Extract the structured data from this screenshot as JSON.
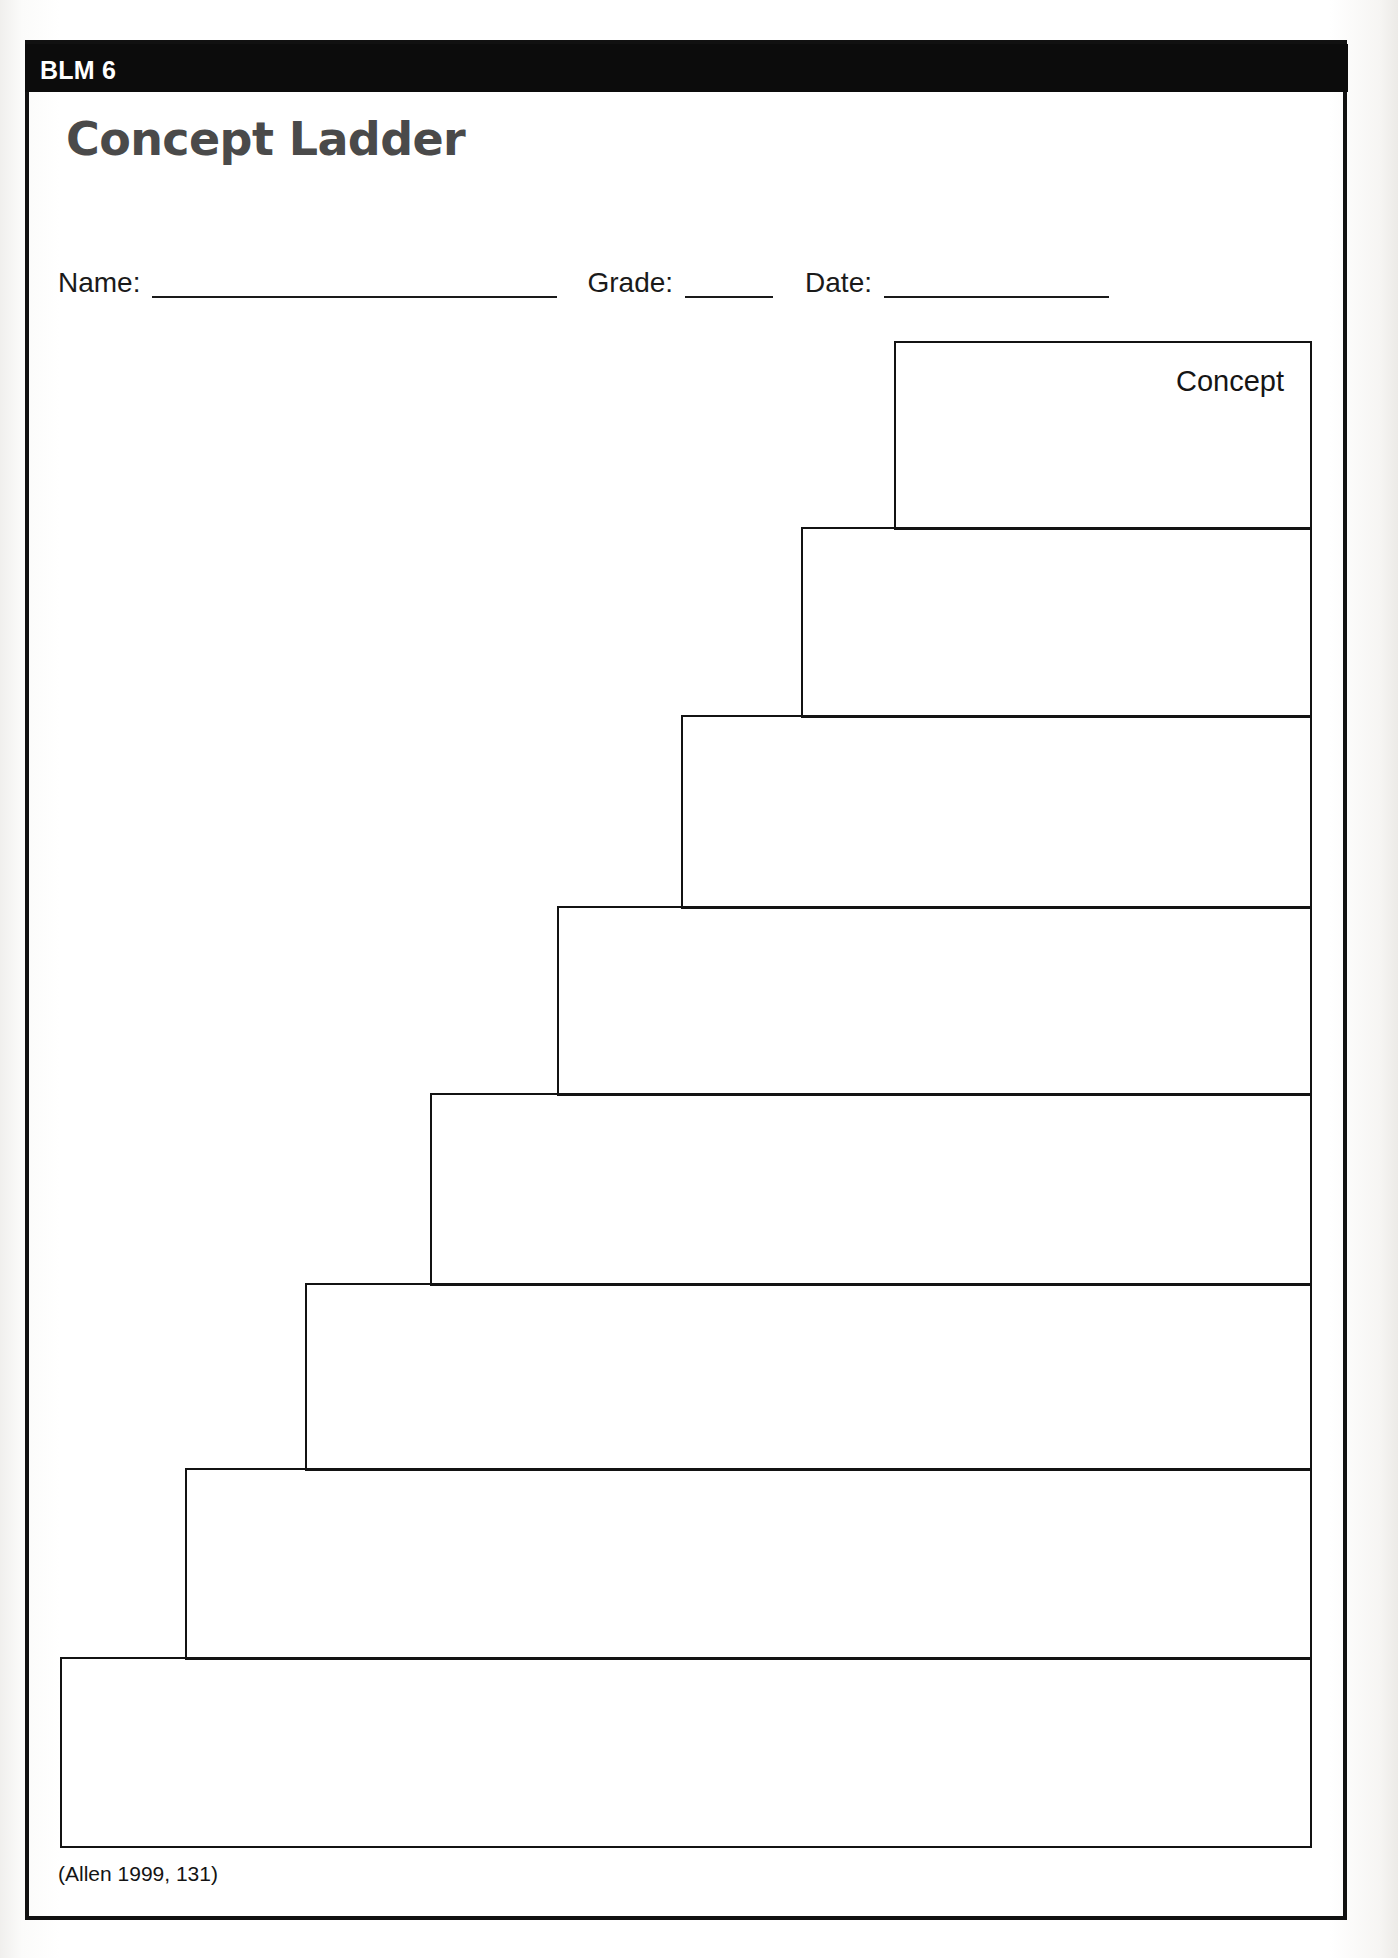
{
  "document": {
    "banner_label": "BLM 6",
    "title": "Concept Ladder",
    "citation": "(Allen 1999, 131)"
  },
  "fields": [
    {
      "id": "name",
      "label": "Name:",
      "value": "",
      "rule_width_px": 405
    },
    {
      "id": "grade",
      "label": "Grade:",
      "value": "",
      "rule_width_px": 88
    },
    {
      "id": "date",
      "label": "Date:",
      "value": "",
      "rule_width_px": 225
    }
  ],
  "ladder": {
    "description": "Eight nested staircase boxes descending left-to-right; each box is a blank writing row. The topmost (smallest) box is labelled Concept.",
    "step_count": 8,
    "right_edge_px": 1312,
    "steps": [
      {
        "index": 1,
        "label": "Concept",
        "left": 894,
        "top": 341,
        "width": 418,
        "height": 189
      },
      {
        "index": 2,
        "label": "",
        "left": 801,
        "top": 527,
        "width": 511,
        "height": 191
      },
      {
        "index": 3,
        "label": "",
        "left": 681,
        "top": 715,
        "width": 631,
        "height": 194
      },
      {
        "index": 4,
        "label": "",
        "left": 557,
        "top": 906,
        "width": 755,
        "height": 190
      },
      {
        "index": 5,
        "label": "",
        "left": 430,
        "top": 1093,
        "width": 882,
        "height": 193
      },
      {
        "index": 6,
        "label": "",
        "left": 305,
        "top": 1283,
        "width": 1007,
        "height": 188
      },
      {
        "index": 7,
        "label": "",
        "left": 185,
        "top": 1468,
        "width": 1127,
        "height": 192
      },
      {
        "index": 8,
        "label": "",
        "left": 60,
        "top": 1657,
        "width": 1252,
        "height": 191
      }
    ]
  },
  "colors": {
    "banner_background": "#0c0c0c",
    "banner_text": "#ffffff",
    "title_text": "#4a4a4a",
    "ink": "#131313",
    "paper": "#ffffff"
  }
}
